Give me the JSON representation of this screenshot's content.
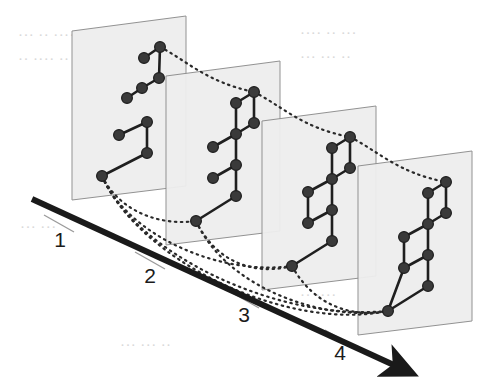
{
  "figure": {
    "background_color": "#ffffff"
  },
  "axis": {
    "name": "stage-axis",
    "style": "thick solid black line with solid triangular arrowhead at the right end",
    "color": "#1a1a1a",
    "stroke_width": 6,
    "start": [
      32,
      199
    ],
    "end": [
      396,
      366
    ],
    "tick_color": "#9a9a9a",
    "labels": [
      {
        "text": "1",
        "x": 60,
        "y": 247
      },
      {
        "text": "2",
        "x": 150,
        "y": 283
      },
      {
        "text": "3",
        "x": 244,
        "y": 322
      },
      {
        "text": "4",
        "x": 340,
        "y": 360
      }
    ],
    "ticks": [
      {
        "x1": 44,
        "y1": 215,
        "x2": 74,
        "y2": 232
      },
      {
        "x1": 135,
        "y1": 252,
        "x2": 165,
        "y2": 269
      },
      {
        "x1": 229,
        "y1": 291,
        "x2": 259,
        "y2": 308
      },
      {
        "x1": 325,
        "y1": 330,
        "x2": 355,
        "y2": 347
      }
    ]
  },
  "plane_style": {
    "fill": "#eeeeee",
    "stroke": "#8d8d8d",
    "stroke_width": 1,
    "opacity": 0.95
  },
  "node_style": {
    "fill": "#3a3a3a",
    "stroke": "#1d1d1d",
    "radius": 5.4,
    "stroke_width": 1.2
  },
  "edge_style": {
    "color": "#1f1f1f",
    "stroke_width": 2.6
  },
  "connector_style": {
    "color": "#2a2a2a",
    "stroke_width": 2.2,
    "dash": "1.5 4.5",
    "description": "dotted curved arcs linking equivalent vertices across consecutive planes"
  },
  "planes": [
    {
      "index": 1,
      "label": "1",
      "name": "plane-1",
      "outline": [
        [
          72,
          31
        ],
        [
          186,
          16
        ],
        [
          186,
          186
        ],
        [
          72,
          200
        ]
      ],
      "nodes": [
        {
          "id": "p1n1",
          "x": 160,
          "y": 47
        },
        {
          "id": "p1n2",
          "x": 144,
          "y": 58
        },
        {
          "id": "p1n3",
          "x": 159,
          "y": 78
        },
        {
          "id": "p1n4",
          "x": 142,
          "y": 88
        },
        {
          "id": "p1n5",
          "x": 127,
          "y": 98
        },
        {
          "id": "p1n6",
          "x": 147,
          "y": 122
        },
        {
          "id": "p1n7",
          "x": 119,
          "y": 135
        },
        {
          "id": "p1n8",
          "x": 147,
          "y": 153
        },
        {
          "id": "p1n9",
          "x": 102,
          "y": 176
        }
      ],
      "edges": [
        [
          "p1n1",
          "p1n2"
        ],
        [
          "p1n1",
          "p1n3"
        ],
        [
          "p1n3",
          "p1n4"
        ],
        [
          "p1n4",
          "p1n5"
        ],
        [
          "p1n6",
          "p1n7"
        ],
        [
          "p1n6",
          "p1n8"
        ],
        [
          "p1n8",
          "p1n9"
        ]
      ]
    },
    {
      "index": 2,
      "label": "2",
      "name": "plane-2",
      "outline": [
        [
          166,
          76
        ],
        [
          280,
          61
        ],
        [
          280,
          231
        ],
        [
          166,
          245
        ]
      ],
      "nodes": [
        {
          "id": "p2n1",
          "x": 254,
          "y": 92
        },
        {
          "id": "p2n2",
          "x": 236,
          "y": 103
        },
        {
          "id": "p2n3",
          "x": 254,
          "y": 123
        },
        {
          "id": "p2n4",
          "x": 236,
          "y": 134
        },
        {
          "id": "p2n5",
          "x": 213,
          "y": 147
        },
        {
          "id": "p2n6",
          "x": 236,
          "y": 165
        },
        {
          "id": "p2n7",
          "x": 213,
          "y": 178
        },
        {
          "id": "p2n8",
          "x": 236,
          "y": 196
        },
        {
          "id": "p2n9",
          "x": 196,
          "y": 221
        }
      ],
      "edges": [
        [
          "p2n1",
          "p2n2"
        ],
        [
          "p2n1",
          "p2n3"
        ],
        [
          "p2n2",
          "p2n4"
        ],
        [
          "p2n3",
          "p2n4"
        ],
        [
          "p2n4",
          "p2n5"
        ],
        [
          "p2n4",
          "p2n6"
        ],
        [
          "p2n6",
          "p2n7"
        ],
        [
          "p2n6",
          "p2n8"
        ],
        [
          "p2n8",
          "p2n9"
        ]
      ]
    },
    {
      "index": 3,
      "label": "3",
      "name": "plane-3",
      "outline": [
        [
          262,
          121
        ],
        [
          376,
          106
        ],
        [
          376,
          276
        ],
        [
          262,
          290
        ]
      ],
      "nodes": [
        {
          "id": "p3n1",
          "x": 350,
          "y": 137
        },
        {
          "id": "p3n2",
          "x": 332,
          "y": 148
        },
        {
          "id": "p3n3",
          "x": 350,
          "y": 168
        },
        {
          "id": "p3n4",
          "x": 332,
          "y": 179
        },
        {
          "id": "p3n5",
          "x": 308,
          "y": 192
        },
        {
          "id": "p3n6",
          "x": 332,
          "y": 210
        },
        {
          "id": "p3n7",
          "x": 308,
          "y": 223
        },
        {
          "id": "p3n8",
          "x": 332,
          "y": 241
        },
        {
          "id": "p3n9",
          "x": 292,
          "y": 266
        }
      ],
      "edges": [
        [
          "p3n1",
          "p3n2"
        ],
        [
          "p3n1",
          "p3n3"
        ],
        [
          "p3n2",
          "p3n4"
        ],
        [
          "p3n3",
          "p3n4"
        ],
        [
          "p3n4",
          "p3n5"
        ],
        [
          "p3n4",
          "p3n6"
        ],
        [
          "p3n5",
          "p3n7"
        ],
        [
          "p3n6",
          "p3n7"
        ],
        [
          "p3n6",
          "p3n8"
        ],
        [
          "p3n8",
          "p3n9"
        ]
      ]
    },
    {
      "index": 4,
      "label": "4",
      "name": "plane-4",
      "outline": [
        [
          358,
          166
        ],
        [
          472,
          151
        ],
        [
          472,
          321
        ],
        [
          358,
          335
        ]
      ],
      "nodes": [
        {
          "id": "p4n1",
          "x": 446,
          "y": 182
        },
        {
          "id": "p4n2",
          "x": 428,
          "y": 193
        },
        {
          "id": "p4n3",
          "x": 446,
          "y": 213
        },
        {
          "id": "p4n4",
          "x": 428,
          "y": 224
        },
        {
          "id": "p4n5",
          "x": 404,
          "y": 237
        },
        {
          "id": "p4n6",
          "x": 428,
          "y": 255
        },
        {
          "id": "p4n7",
          "x": 404,
          "y": 268
        },
        {
          "id": "p4n8",
          "x": 428,
          "y": 286
        },
        {
          "id": "p4n9",
          "x": 388,
          "y": 311
        }
      ],
      "edges": [
        [
          "p4n1",
          "p4n2"
        ],
        [
          "p4n1",
          "p4n3"
        ],
        [
          "p4n2",
          "p4n4"
        ],
        [
          "p4n3",
          "p4n4"
        ],
        [
          "p4n4",
          "p4n5"
        ],
        [
          "p4n4",
          "p4n6"
        ],
        [
          "p4n5",
          "p4n7"
        ],
        [
          "p4n6",
          "p4n7"
        ],
        [
          "p4n6",
          "p4n8"
        ],
        [
          "p4n7",
          "p4n9"
        ],
        [
          "p4n8",
          "p4n9"
        ]
      ]
    }
  ],
  "connectors": [
    {
      "name": "top-arc-1-2",
      "from": "p1n1",
      "to": "p2n1",
      "path": "M160,47 C186,60 206,82 254,92"
    },
    {
      "name": "top-arc-2-3",
      "from": "p2n1",
      "to": "p3n1",
      "path": "M254,92 C282,106 302,128 350,137"
    },
    {
      "name": "top-arc-3-4",
      "from": "p3n1",
      "to": "p4n1",
      "path": "M350,137 C378,151 398,173 446,182"
    },
    {
      "name": "bottom-arc-1-2",
      "from": "p1n9",
      "to": "p2n9",
      "path": "M102,176 C120,212 160,226 196,221"
    },
    {
      "name": "bottom-arc-1-3",
      "from": "p1n9",
      "to": "p3n9",
      "path": "M102,176 C128,236 220,276 292,266"
    },
    {
      "name": "bottom-arc-1-4",
      "from": "p1n9",
      "to": "p4n9",
      "path": "M102,176 C134,252 276,322 388,311"
    },
    {
      "name": "bottom-arc-1-4b",
      "from": "p1n9",
      "to": "p4n9",
      "path": "M102,176 C140,262 288,332 388,311"
    },
    {
      "name": "bottom-arc-2-3",
      "from": "p2n9",
      "to": "p3n9",
      "path": "M196,221 C216,262 254,276 292,266"
    },
    {
      "name": "bottom-arc-2-4",
      "from": "p2n9",
      "to": "p4n9",
      "path": "M196,221 C226,288 324,322 388,311"
    },
    {
      "name": "bottom-arc-3-4",
      "from": "p3n9",
      "to": "p4n9",
      "path": "M292,266 C314,306 352,318 388,311"
    }
  ],
  "background_bleed": {
    "note": "faint show-through text from the reverse side of the scanned page, largely illegible",
    "lines": [
      {
        "x": 18,
        "y": 40,
        "text": "···  ··  ····",
        "size": "big"
      },
      {
        "x": 300,
        "y": 38,
        "text": "····  ··  ···",
        "size": "big"
      },
      {
        "x": 18,
        "y": 64,
        "text": "··  ····  ··",
        "size": "big"
      },
      {
        "x": 300,
        "y": 62,
        "text": "···  ···  ··",
        "size": "big"
      },
      {
        "x": 20,
        "y": 232,
        "text": "···  ···",
        "size": "big"
      },
      {
        "x": 300,
        "y": 300,
        "text": "··  ····",
        "size": "big"
      },
      {
        "x": 120,
        "y": 350,
        "text": "···  ···  ··",
        "size": "big"
      }
    ]
  }
}
